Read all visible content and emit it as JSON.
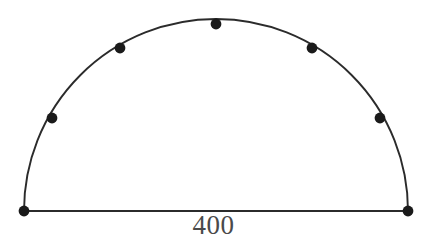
{
  "figure": {
    "type": "semicircle-with-points",
    "background_color": "#ffffff",
    "stroke_color": "#2b2b2b",
    "point_color": "#1a1a1a",
    "label_color": "#4a4a4a",
    "stroke_width": 1.9,
    "point_radius": 5.4,
    "diameter_label": "400",
    "geometry": {
      "center_x": 216,
      "center_y": 211,
      "radius": 192,
      "baseline_y": 211,
      "left_endpoint_x": 24,
      "right_endpoint_x": 408,
      "apex_x": 216,
      "apex_y": 24,
      "arc_divisions": 6
    },
    "points": [
      {
        "name": "left-endpoint",
        "x": 24,
        "y": 211,
        "angle_deg": 180
      },
      {
        "name": "arc-point-1",
        "x": 52,
        "y": 118,
        "angle_deg": 150
      },
      {
        "name": "arc-point-2",
        "x": 120,
        "y": 48,
        "angle_deg": 120
      },
      {
        "name": "arc-apex",
        "x": 216,
        "y": 24,
        "angle_deg": 90
      },
      {
        "name": "arc-point-4",
        "x": 312,
        "y": 48,
        "angle_deg": 60
      },
      {
        "name": "arc-point-5",
        "x": 380,
        "y": 118,
        "angle_deg": 30
      },
      {
        "name": "right-endpoint",
        "x": 408,
        "y": 211,
        "angle_deg": 0
      }
    ]
  }
}
